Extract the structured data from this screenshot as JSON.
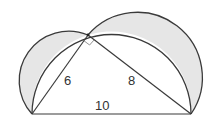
{
  "diagram": {
    "vertices": {
      "A": {
        "x": 32,
        "y": 114
      },
      "B": {
        "x": 191,
        "y": 114
      },
      "C": {
        "x": 88,
        "y": 35
      }
    },
    "labels": {
      "leg_ac": "6",
      "leg_cb": "8",
      "hypotenuse": "10"
    },
    "colors": {
      "stroke": "#3a3a3a",
      "lune_fill": "#e6e6e6",
      "background": "#ffffff"
    },
    "right_angle_at": "C"
  }
}
